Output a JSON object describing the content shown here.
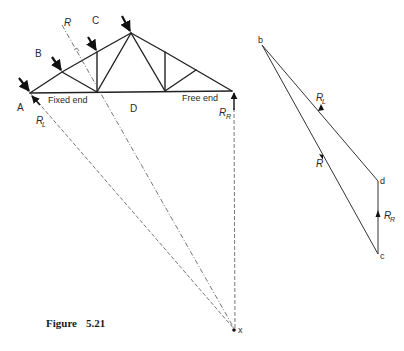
{
  "figure": {
    "caption_label": "Figure",
    "caption_number": "5.21"
  },
  "truss": {
    "zone_labels": {
      "A": "A",
      "B": "B",
      "C": "C",
      "D": "D"
    },
    "support_labels": {
      "fixed": "Fixed end",
      "free": "Free end"
    },
    "reactions": {
      "left": {
        "main": "R",
        "sub": "L"
      },
      "right": {
        "main": "R",
        "sub": "R"
      },
      "resultant": {
        "main": "R"
      }
    },
    "intersection_point": "x"
  },
  "force_diagram": {
    "points": {
      "b": "b",
      "c": "c",
      "d": "d"
    },
    "vectors": {
      "RL": {
        "main": "R",
        "sub": "L"
      },
      "R": {
        "main": "R"
      },
      "RR": {
        "main": "R",
        "sub": "R"
      }
    }
  }
}
